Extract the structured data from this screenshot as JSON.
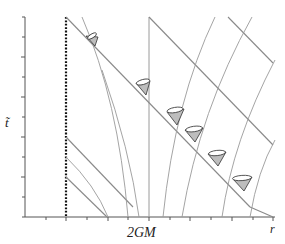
{
  "diagram": {
    "axes": {
      "y_label": "t̃",
      "x_label": "r",
      "x_marker_label": "2GM"
    },
    "colors": {
      "axis": "#555555",
      "line": "#8a8a8a",
      "cone_fill": "#bdbdbd",
      "cone_stroke": "#333333",
      "singularity": "#111111"
    },
    "elements": {
      "singularity": "r = 0 (dotted line)",
      "horizon": "r = 2GM (vertical line)",
      "light_cones_count": 6
    }
  }
}
